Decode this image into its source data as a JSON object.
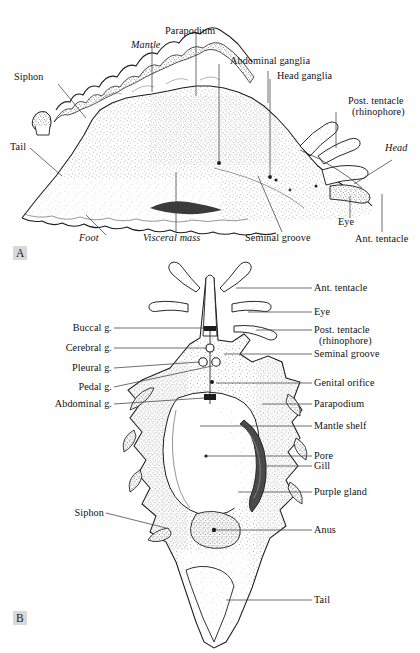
{
  "figure": {
    "panels": [
      {
        "id": "A",
        "letter": "A",
        "view": "lateral view",
        "labels": [
          {
            "text": "Siphon",
            "italic": false
          },
          {
            "text": "Mantle",
            "italic": true
          },
          {
            "text": "Parapodium",
            "italic": false
          },
          {
            "text": "Abdominal ganglia",
            "italic": false
          },
          {
            "text": "Head ganglia",
            "italic": false
          },
          {
            "text": "Post. tentacle",
            "italic": false
          },
          {
            "text": "(rhinophore)",
            "italic": false
          },
          {
            "text": "Head",
            "italic": true
          },
          {
            "text": "Tail",
            "italic": false
          },
          {
            "text": "Foot",
            "italic": true
          },
          {
            "text": "Visceral mass",
            "italic": true
          },
          {
            "text": "Seminal groove",
            "italic": false
          },
          {
            "text": "Eye",
            "italic": false
          },
          {
            "text": "Ant. tentacle",
            "italic": false
          }
        ]
      },
      {
        "id": "B",
        "letter": "B",
        "view": "dorsal view",
        "labels_left": [
          {
            "text": "Buccal g."
          },
          {
            "text": "Cerebral g."
          },
          {
            "text": "Pleural g."
          },
          {
            "text": "Pedal g."
          },
          {
            "text": "Abdominal g."
          },
          {
            "text": "Siphon"
          }
        ],
        "labels_right": [
          {
            "text": "Ant. tentacle"
          },
          {
            "text": "Eye"
          },
          {
            "text": "Post. tentacle"
          },
          {
            "text": "(rhinophore)"
          },
          {
            "text": "Seminal groove"
          },
          {
            "text": "Genital orifice"
          },
          {
            "text": "Parapodium"
          },
          {
            "text": "Mantle shelf"
          },
          {
            "text": "Pore"
          },
          {
            "text": "Gill"
          },
          {
            "text": "Purple gland"
          },
          {
            "text": "Anus"
          },
          {
            "text": "Tail"
          }
        ]
      }
    ],
    "colors": {
      "ink": "#1a1a1a",
      "leader_line": "#4a4a4a",
      "panel_letter_bg": "#d9d9d9",
      "page": "#ffffff",
      "stipple": "#555555",
      "shade_dark": "#3a3a3a"
    },
    "caption_fragment": ""
  }
}
